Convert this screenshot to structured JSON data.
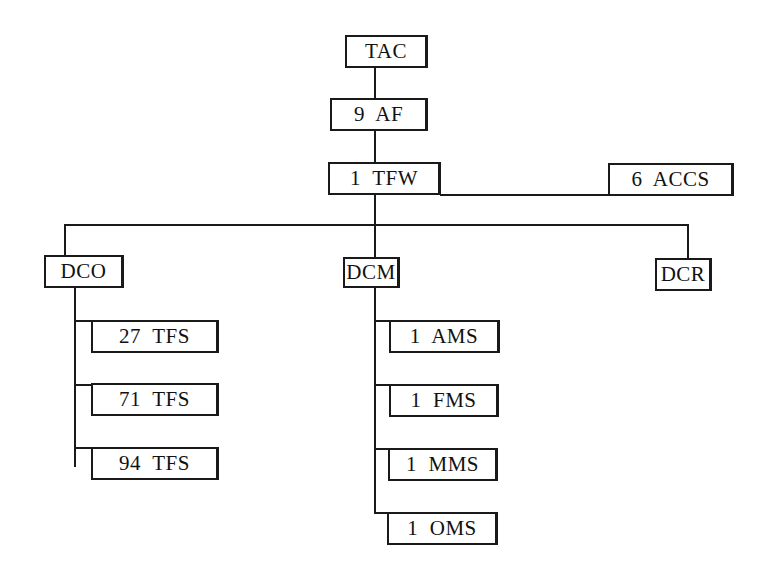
{
  "diagram": {
    "type": "organization-chart",
    "nodes": {
      "tac": "TAC",
      "af9": "9  AF",
      "tfw1": "1  TFW",
      "accs6": "6  ACCS",
      "dco": "DCO",
      "dcm": "DCM",
      "dcr": "DCR",
      "tfs27": "27  TFS",
      "tfs71": "71  TFS",
      "tfs94": "94  TFS",
      "ams1": "1  AMS",
      "fms1": "1  FMS",
      "mms1": "1  MMS",
      "oms1": "1  OMS"
    },
    "edges": [
      [
        "TAC",
        "9 AF"
      ],
      [
        "9 AF",
        "1 TFW"
      ],
      [
        "1 TFW",
        "6 ACCS"
      ],
      [
        "1 TFW",
        "DCO"
      ],
      [
        "1 TFW",
        "DCM"
      ],
      [
        "1 TFW",
        "DCR"
      ],
      [
        "DCO",
        "27 TFS"
      ],
      [
        "DCO",
        "71 TFS"
      ],
      [
        "DCO",
        "94 TFS"
      ],
      [
        "DCM",
        "1 AMS"
      ],
      [
        "DCM",
        "1 FMS"
      ],
      [
        "DCM",
        "1 MMS"
      ],
      [
        "DCM",
        "1 OMS"
      ]
    ]
  }
}
